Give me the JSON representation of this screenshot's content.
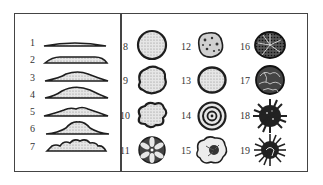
{
  "figure": {
    "elevation_profiles": [
      {
        "label": "1"
      },
      {
        "label": "2"
      },
      {
        "label": "3"
      },
      {
        "label": "4"
      },
      {
        "label": "5"
      },
      {
        "label": "6"
      },
      {
        "label": "7"
      }
    ],
    "surface_forms": [
      {
        "label": "8",
        "kind": "smooth-round"
      },
      {
        "label": "9",
        "kind": "irregular-lobed"
      },
      {
        "label": "10",
        "kind": "lobate"
      },
      {
        "label": "11",
        "kind": "petaloid-segmented"
      },
      {
        "label": "12",
        "kind": "mottled-granular"
      },
      {
        "label": "13",
        "kind": "smooth-oval"
      },
      {
        "label": "14",
        "kind": "concentric-rings"
      },
      {
        "label": "15",
        "kind": "wavy-edge-center-dark"
      },
      {
        "label": "16",
        "kind": "dark-radiate"
      },
      {
        "label": "17",
        "kind": "wrinkled-convoluted"
      },
      {
        "label": "18",
        "kind": "spiky-rhizoid"
      },
      {
        "label": "19",
        "kind": "filamentous-spiky"
      }
    ]
  },
  "colors": {
    "ink": "#1e1e1e",
    "frame": "#444444",
    "fill_light": "#d8d8d8"
  }
}
